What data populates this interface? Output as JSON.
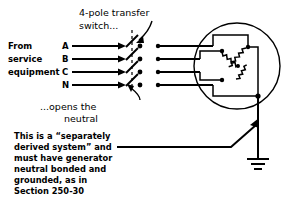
{
  "figure": {
    "background_color": "#ffffff",
    "ink_color": "#000000"
  },
  "annotations": {
    "switch_label_line1": "4-pole transfer",
    "switch_label_line2": "switch...",
    "neutral_label_line1": "...opens the",
    "neutral_label_line2": "neutral"
  },
  "source": {
    "label_line1": "From",
    "label_line2": "service",
    "label_line3": "equipment",
    "conductors": [
      {
        "name": "A"
      },
      {
        "name": "B"
      },
      {
        "name": "C"
      },
      {
        "name": "N"
      }
    ]
  },
  "note": {
    "lines": [
      "This is a “separately",
      "derived system” and",
      "must have generator",
      "neutral bonded and",
      "grounded, as in",
      "Section 250-30"
    ]
  },
  "generator": {
    "winding_type": "wye",
    "coil_count": 3,
    "grounded": true,
    "ground_symbol": "earth-ground"
  }
}
